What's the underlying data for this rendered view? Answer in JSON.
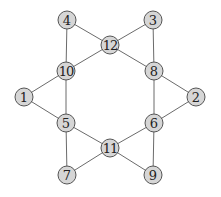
{
  "graph": {
    "nodes": [
      {
        "id": "1",
        "label": "1",
        "x": 24,
        "y": 97
      },
      {
        "id": "2",
        "label": "2",
        "x": 196,
        "y": 97
      },
      {
        "id": "3",
        "label": "3",
        "x": 153,
        "y": 20
      },
      {
        "id": "4",
        "label": "4",
        "x": 67,
        "y": 20
      },
      {
        "id": "5",
        "label": "5",
        "x": 66,
        "y": 123
      },
      {
        "id": "6",
        "label": "6",
        "x": 154,
        "y": 123
      },
      {
        "id": "7",
        "label": "7",
        "x": 67,
        "y": 175
      },
      {
        "id": "8",
        "label": "8",
        "x": 154,
        "y": 71
      },
      {
        "id": "9",
        "label": "9",
        "x": 153,
        "y": 175
      },
      {
        "id": "10",
        "label": "10",
        "x": 66,
        "y": 71
      },
      {
        "id": "11",
        "label": "11",
        "x": 110,
        "y": 148
      },
      {
        "id": "12",
        "label": "12",
        "x": 110,
        "y": 45
      }
    ],
    "edges": [
      [
        "4",
        "12"
      ],
      [
        "3",
        "12"
      ],
      [
        "12",
        "10"
      ],
      [
        "12",
        "8"
      ],
      [
        "4",
        "10"
      ],
      [
        "3",
        "8"
      ],
      [
        "10",
        "1"
      ],
      [
        "10",
        "5"
      ],
      [
        "1",
        "5"
      ],
      [
        "8",
        "2"
      ],
      [
        "8",
        "6"
      ],
      [
        "2",
        "6"
      ],
      [
        "5",
        "11"
      ],
      [
        "6",
        "11"
      ],
      [
        "5",
        "7"
      ],
      [
        "7",
        "11"
      ],
      [
        "11",
        "9"
      ],
      [
        "6",
        "9"
      ]
    ],
    "node_radius": 9,
    "colors": {
      "node_fill": "#d6d6d6",
      "node_stroke": "#555555",
      "edge": "#6b6b6b",
      "label": "#222222"
    }
  }
}
